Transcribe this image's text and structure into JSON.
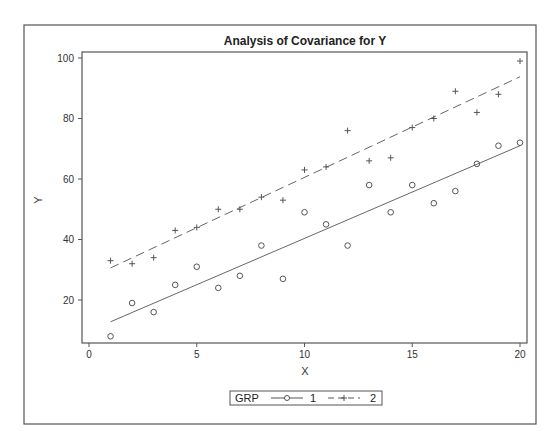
{
  "chart_data": {
    "type": "scatter",
    "title": "Analysis of Covariance for Y",
    "xlabel": "X",
    "ylabel": "Y",
    "xlim": [
      0,
      20
    ],
    "ylim": [
      6,
      102
    ],
    "x_ticks": [
      0,
      5,
      10,
      15,
      20
    ],
    "y_ticks": [
      20,
      40,
      60,
      80,
      100
    ],
    "grid": false,
    "legend": {
      "title": "GRP",
      "placement": "bottom-center",
      "entries": [
        {
          "label": "1",
          "marker": "circle",
          "line": "solid"
        },
        {
          "label": "2",
          "marker": "plus",
          "line": "dashed"
        }
      ]
    },
    "series": [
      {
        "name": "1",
        "marker": "circle",
        "color": "#555555",
        "x": [
          1,
          2,
          3,
          4,
          5,
          6,
          7,
          8,
          9,
          10,
          11,
          12,
          13,
          14,
          15,
          16,
          17,
          18,
          19,
          20
        ],
        "y": [
          8,
          19,
          16,
          25,
          31,
          24,
          28,
          38,
          27,
          49,
          45,
          38,
          58,
          49,
          58,
          52,
          56,
          65,
          71,
          72
        ],
        "fit_line": {
          "style": "solid",
          "x": [
            1,
            20
          ],
          "y": [
            12.8,
            71
          ]
        }
      },
      {
        "name": "2",
        "marker": "plus",
        "color": "#555555",
        "x": [
          1,
          2,
          3,
          4,
          5,
          6,
          7,
          8,
          9,
          10,
          11,
          12,
          13,
          14,
          15,
          16,
          17,
          18,
          19,
          20
        ],
        "y": [
          33,
          32,
          34,
          43,
          44,
          50,
          50,
          54,
          53,
          63,
          64,
          76,
          66,
          67,
          77,
          80,
          89,
          82,
          88,
          99
        ],
        "fit_line": {
          "style": "dashed",
          "x": [
            1,
            20
          ],
          "y": [
            30.6,
            93.8
          ]
        }
      }
    ]
  }
}
